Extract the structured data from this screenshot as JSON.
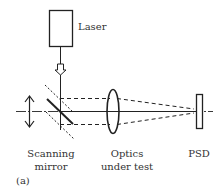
{
  "labels": {
    "laser": "Laser",
    "mirror_line1": "Scanning",
    "mirror_line2": "mirror",
    "optics_line1": "Optics",
    "optics_line2": "under test",
    "psd": "PSD",
    "panel": "(a)"
  },
  "colors": {
    "stroke": "#222222",
    "text": "#333333",
    "background": "#ffffff"
  }
}
